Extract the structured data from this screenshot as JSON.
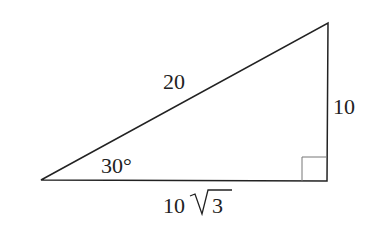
{
  "diagram": {
    "type": "right-triangle",
    "labels": {
      "hypotenuse": "20",
      "opposite_side": "10",
      "adjacent_prefix": "10",
      "adjacent_radicand": "3",
      "angle": "30°"
    },
    "stroke_color": "#222222",
    "right_angle_marker_color": "#777777"
  }
}
